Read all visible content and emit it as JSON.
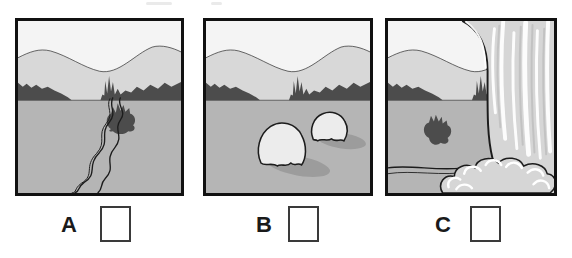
{
  "worksheet": {
    "panels": [
      {
        "label": "A",
        "scene": "winding-river-landscape",
        "answer": ""
      },
      {
        "label": "B",
        "scene": "two-boulders-landscape",
        "answer": ""
      },
      {
        "label": "C",
        "scene": "waterfall-landscape",
        "answer": ""
      }
    ]
  },
  "colors": {
    "sky": "#f4f4f4",
    "hill": "#d8d8d8",
    "trees": "#4c4c4c",
    "ground": "#b5b5b5",
    "rock": "#ececec",
    "shadow": "#9c9c9c",
    "waterfall": "#d6d6d6",
    "outline": "#1c1c1c",
    "frame": "#111111",
    "label_text": "#1a1a1a",
    "box_border": "#3a3a3a"
  }
}
